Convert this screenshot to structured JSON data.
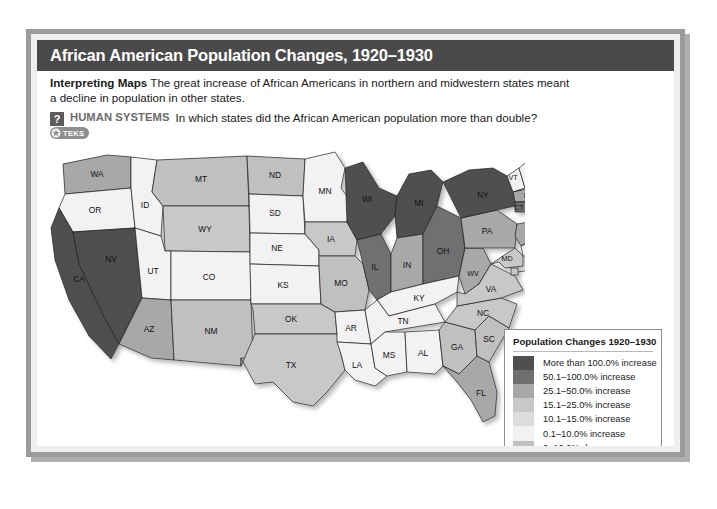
{
  "figure": {
    "title": "African American Population Changes, 1920–1930",
    "caption_lead": "Interpreting Maps",
    "caption_text": "The great increase of African Americans in northern and midwestern states meant a decline in population in other states.",
    "question_marker": "?",
    "question_theme": "HUMAN SYSTEMS",
    "question_text": "In which states did the African American population more than double?",
    "teks_label": "TEKS"
  },
  "legend": {
    "title": "Population Changes 1920–1930",
    "items": [
      {
        "label": "More than 100.0% increase",
        "color": "#4f4f4f"
      },
      {
        "label": "50.1–100.0% increase",
        "color": "#6f6f6f"
      },
      {
        "label": "25.1–50.0% increase",
        "color": "#a8a8a8"
      },
      {
        "label": "15.1–25.0% increase",
        "color": "#c8c8c8"
      },
      {
        "label": "10.1–15.0% increase",
        "color": "#dcdcdc"
      },
      {
        "label": "0.1–10.0% increase",
        "color": "#f2f2f2"
      },
      {
        "label": "0–10.0% decrease",
        "color": "#c0c0c0"
      },
      {
        "label": "More than 10.0% decrease",
        "color": "#9a9a9a"
      }
    ]
  },
  "chart_data": {
    "type": "map",
    "title": "African American Population Changes, 1920–1930",
    "legend_title": "Population Changes 1920–1930",
    "legend_position": "right",
    "bins": [
      "More than 100.0% increase",
      "50.1–100.0% increase",
      "25.1–50.0% increase",
      "15.1–25.0% increase",
      "10.1–15.0% increase",
      "0.1–10.0% increase",
      "0–10.0% decrease",
      "More than 10.0% decrease"
    ],
    "bin_colors": [
      "#4f4f4f",
      "#6f6f6f",
      "#a8a8a8",
      "#c8c8c8",
      "#dcdcdc",
      "#f2f2f2",
      "#c0c0c0",
      "#9a9a9a"
    ],
    "regions": [
      {
        "code": "WA",
        "bin": 2
      },
      {
        "code": "OR",
        "bin": 5
      },
      {
        "code": "ID",
        "bin": 5
      },
      {
        "code": "MT",
        "bin": 6
      },
      {
        "code": "WY",
        "bin": 3
      },
      {
        "code": "ND",
        "bin": 6
      },
      {
        "code": "SD",
        "bin": 5
      },
      {
        "code": "MN",
        "bin": 5
      },
      {
        "code": "NE",
        "bin": 5
      },
      {
        "code": "IA",
        "bin": 3
      },
      {
        "code": "CA",
        "bin": 0
      },
      {
        "code": "NV",
        "bin": 0
      },
      {
        "code": "UT",
        "bin": 5
      },
      {
        "code": "CO",
        "bin": 5
      },
      {
        "code": "KS",
        "bin": 5
      },
      {
        "code": "MO",
        "bin": 6
      },
      {
        "code": "AZ",
        "bin": 2
      },
      {
        "code": "NM",
        "bin": 6
      },
      {
        "code": "OK",
        "bin": 3
      },
      {
        "code": "TX",
        "bin": 3
      },
      {
        "code": "AR",
        "bin": 5
      },
      {
        "code": "LA",
        "bin": 5
      },
      {
        "code": "MS",
        "bin": 5
      },
      {
        "code": "AL",
        "bin": 5
      },
      {
        "code": "TN",
        "bin": 5
      },
      {
        "code": "KY",
        "bin": 5
      },
      {
        "code": "WI",
        "bin": 0
      },
      {
        "code": "MI",
        "bin": 0
      },
      {
        "code": "IL",
        "bin": 1
      },
      {
        "code": "IN",
        "bin": 2
      },
      {
        "code": "OH",
        "bin": 1
      },
      {
        "code": "WV",
        "bin": 2
      },
      {
        "code": "GA",
        "bin": 6
      },
      {
        "code": "FL",
        "bin": 2
      },
      {
        "code": "SC",
        "bin": 6
      },
      {
        "code": "NC",
        "bin": 3
      },
      {
        "code": "VA",
        "bin": 3
      },
      {
        "code": "PA",
        "bin": 2
      },
      {
        "code": "NY",
        "bin": 0
      },
      {
        "code": "ME",
        "bin": 5
      },
      {
        "code": "VT",
        "bin": 5
      },
      {
        "code": "NH",
        "bin": 5
      },
      {
        "code": "MA",
        "bin": 2
      },
      {
        "code": "CT",
        "bin": 1
      },
      {
        "code": "RI",
        "bin": 3
      },
      {
        "code": "NJ",
        "bin": 2
      },
      {
        "code": "DE",
        "bin": 5
      },
      {
        "code": "MD",
        "bin": 3
      },
      {
        "code": "DC",
        "bin": 3
      }
    ],
    "labels": {
      "WA": "WA",
      "OR": "OR",
      "ID": "ID",
      "MT": "MT",
      "WY": "WY",
      "ND": "ND",
      "SD": "SD",
      "MN": "MN",
      "NE": "NE",
      "IA": "IA",
      "CA": "CA",
      "NV": "NV",
      "UT": "UT",
      "CO": "CO",
      "KS": "KS",
      "MO": "MO",
      "AZ": "AZ",
      "NM": "NM",
      "OK": "OK",
      "TX": "TX",
      "AR": "AR",
      "LA": "LA",
      "MS": "MS",
      "AL": "AL",
      "TN": "TN",
      "KY": "KY",
      "WI": "WI",
      "MI": "MI",
      "IL": "IL",
      "IN": "IN",
      "OH": "OH",
      "WV": "WV",
      "GA": "GA",
      "FL": "FL",
      "SC": "SC",
      "NC": "NC",
      "VA": "VA",
      "PA": "PA",
      "NY": "NY",
      "ME": "ME",
      "VT": "VT",
      "NH": "NH",
      "MA": "MA",
      "CT": "CT",
      "RI": "RI",
      "NJ": "NJ",
      "DE": "DE",
      "MD": "MD",
      "DC": "DC"
    }
  }
}
